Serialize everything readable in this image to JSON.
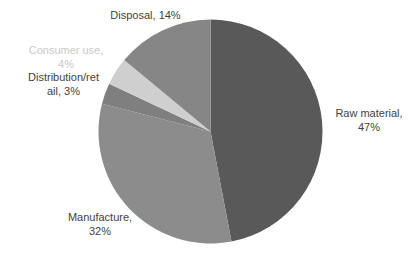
{
  "chart_data": {
    "type": "pie",
    "title": "",
    "subtitle": "",
    "legend_position": "none",
    "grid": false,
    "start_angle_deg": 0,
    "direction": "clockwise",
    "categories": [
      "Raw material",
      "Manufacture",
      "Distribution/retail",
      "Consumer use",
      "Disposal"
    ],
    "values": [
      47,
      32,
      3,
      4,
      14
    ],
    "value_unit": "%",
    "colors": [
      "#595959",
      "#8c8c8c",
      "#7f7f7f",
      "#cfcfcf",
      "#868686"
    ],
    "slices": [
      {
        "name": "Raw material",
        "value": 47,
        "label": "Raw material,\n47%",
        "color": "#595959",
        "label_color": "#3f3f3f"
      },
      {
        "name": "Manufacture",
        "value": 32,
        "label": "Manufacture,\n32%",
        "color": "#8c8c8c",
        "label_color": "#3f3f3f"
      },
      {
        "name": "Distribution/retail",
        "value": 3,
        "label": "Distribution/ret\nail, 3%",
        "color": "#7f7f7f",
        "label_color": "#3f3f3f"
      },
      {
        "name": "Consumer use",
        "value": 4,
        "label": "Consumer use,\n4%",
        "color": "#cfcfcf",
        "label_color": "#c9c9c9"
      },
      {
        "name": "Disposal",
        "value": 14,
        "label": "Disposal,  14%",
        "color": "#868686",
        "label_color": "#3f3f3f"
      }
    ],
    "xlabel": "",
    "ylabel": ""
  },
  "labels": {
    "disposal": "Disposal,  14%",
    "consumer_use": "Consumer use,\n4%",
    "distribution_retail": "Distribution/ret\nail, 3%",
    "raw_material": "Raw material,\n47%",
    "manufacture": "Manufacture,\n32%"
  },
  "style": {
    "background": "#ffffff",
    "label_color": "#3f3f3f",
    "muted_label_color": "#c9c9c9"
  }
}
